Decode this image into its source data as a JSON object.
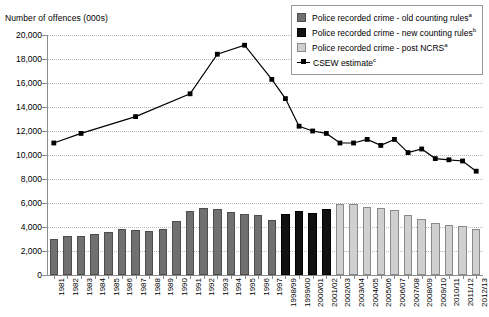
{
  "chart_data": {
    "type": "bar",
    "title": "",
    "ylabel": "Number of offences (000s)",
    "xlabel": "",
    "ylim": [
      0,
      20000
    ],
    "ytick_step": 2000,
    "ytick_labels": [
      "20,000",
      "18,000",
      "16,000",
      "14,000",
      "12,000",
      "10,000",
      "8,000",
      "6,000",
      "4,000",
      "2,000",
      "0"
    ],
    "grid": true,
    "legend_position": "top-right",
    "categories": [
      "1981",
      "1982",
      "1983",
      "1984",
      "1985",
      "1986",
      "1987",
      "1988",
      "1989",
      "1990",
      "1991",
      "1992",
      "1993",
      "1994",
      "1995",
      "1996",
      "1997",
      "1998/99",
      "1999/00",
      "2000/01",
      "2001/02",
      "2002/03",
      "2003/04",
      "2004/05",
      "2005/06",
      "2006/07",
      "2007/08",
      "2008/09",
      "2009/10",
      "2010/11",
      "2011/12",
      "2012/13"
    ],
    "series": [
      {
        "name": "Police recorded crime - old counting rules",
        "key": "old",
        "color": "#707070",
        "values": [
          3000,
          3250,
          3250,
          3450,
          3550,
          3800,
          3750,
          3700,
          3850,
          4500,
          5300,
          5600,
          5500,
          5250,
          5100,
          5000,
          4600,
          null,
          null,
          null,
          null,
          null,
          null,
          null,
          null,
          null,
          null,
          null,
          null,
          null,
          null,
          null
        ]
      },
      {
        "name": "Police recorded crime - new counting rules",
        "key": "new",
        "color": "#111111",
        "values": [
          null,
          null,
          null,
          null,
          null,
          null,
          null,
          null,
          null,
          null,
          null,
          null,
          null,
          null,
          null,
          null,
          null,
          5100,
          5300,
          5200,
          5500,
          null,
          null,
          null,
          null,
          null,
          null,
          null,
          null,
          null,
          null,
          null
        ]
      },
      {
        "name": "Police recorded crime - post NCRS",
        "key": "ncrs",
        "color": "#d0d0d0",
        "values": [
          null,
          null,
          null,
          null,
          null,
          null,
          null,
          null,
          null,
          null,
          null,
          null,
          null,
          null,
          null,
          null,
          null,
          null,
          null,
          null,
          null,
          5950,
          5950,
          5650,
          5550,
          5450,
          5000,
          4700,
          4350,
          4200,
          4050,
          3800
        ]
      },
      {
        "name": "CSEW estimate",
        "key": "csew",
        "color": "#000000",
        "type": "line",
        "values": [
          11000,
          null,
          11800,
          null,
          null,
          null,
          13200,
          null,
          null,
          null,
          15100,
          null,
          18400,
          null,
          19150,
          null,
          16300,
          14700,
          12400,
          12000,
          11800,
          11000,
          11000,
          11300,
          10800,
          11300,
          10200,
          10500,
          9700,
          9600,
          9500,
          8650
        ]
      }
    ],
    "legend": [
      {
        "label_prefix": "Police recorded crime - old counting rules",
        "sup": "a",
        "swatch": "old"
      },
      {
        "label_prefix": "Police recorded crime - new counting rules",
        "sup": "b",
        "swatch": "new"
      },
      {
        "label_prefix": "Police recorded crime - post NCRS",
        "sup": "a",
        "swatch": "ncrs"
      },
      {
        "label_prefix": "CSEW estimate",
        "sup": "c",
        "swatch": "line"
      }
    ]
  }
}
